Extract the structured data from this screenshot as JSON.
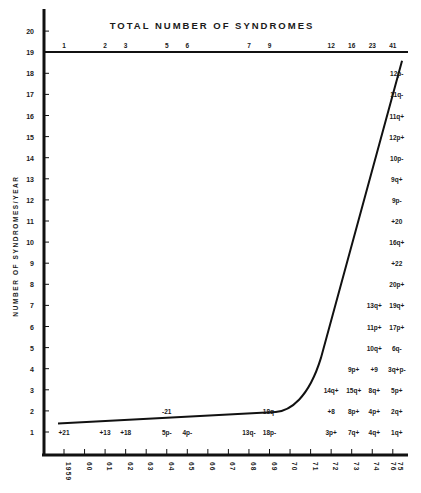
{
  "chart_data": {
    "type": "line",
    "title": "TOTAL NUMBER OF SYNDROMES",
    "xlabel": "",
    "ylabel": "NUMBER OF SYNDROMES/YEAR",
    "ylim": [
      0,
      20
    ],
    "y_ticks": [
      "1",
      "2",
      "3",
      "4",
      "5",
      "6",
      "7",
      "8",
      "9",
      "10",
      "11",
      "12",
      "13",
      "14",
      "15",
      "16",
      "17",
      "18",
      "19",
      "20"
    ],
    "x_ticks": [
      "1959",
      "60",
      "61",
      "62",
      "63",
      "64",
      "65",
      "66",
      "67",
      "68",
      "69",
      "70",
      "71",
      "72",
      "73",
      "74",
      "75 76"
    ],
    "grid": false,
    "top_axis_label": "TOTAL NUMBER OF SYNDROMES",
    "top_axis_cumulative": [
      {
        "year": "1959",
        "total": "1"
      },
      {
        "year": "61",
        "total": "2"
      },
      {
        "year": "62",
        "total": "3"
      },
      {
        "year": "64",
        "total": "5"
      },
      {
        "year": "65",
        "total": "6"
      },
      {
        "year": "68",
        "total": "7"
      },
      {
        "year": "69",
        "total": "9"
      },
      {
        "year": "72",
        "total": "12"
      },
      {
        "year": "73",
        "total": "16"
      },
      {
        "year": "74",
        "total": "23"
      },
      {
        "year": "75-76",
        "total": "41"
      }
    ],
    "curve": {
      "description": "cumulative trend curve",
      "x": [
        1959,
        1962,
        1965,
        1968,
        1969.3,
        1970,
        1971,
        1971.8,
        1975.5
      ],
      "y": [
        1.4,
        1.55,
        1.7,
        1.85,
        1.95,
        2.2,
        3.5,
        5.0,
        18.6
      ]
    },
    "annotations": [
      {
        "text": "+21",
        "year": "1959",
        "row": 1
      },
      {
        "text": "+13",
        "year": "61",
        "row": 1
      },
      {
        "text": "+18",
        "year": "62",
        "row": 1
      },
      {
        "text": "5p-",
        "year": "64",
        "row": 1
      },
      {
        "text": "4p-",
        "year": "65",
        "row": 1
      },
      {
        "text": "-21",
        "year": "64",
        "row": 2
      },
      {
        "text": "13q-",
        "year": "68",
        "row": 1
      },
      {
        "text": "18p-",
        "year": "69",
        "row": 1
      },
      {
        "text": "18q-",
        "year": "69",
        "row": 2
      },
      {
        "text": "3p+",
        "year": "72",
        "row": 1
      },
      {
        "text": "+8",
        "year": "72",
        "row": 2
      },
      {
        "text": "14q+",
        "year": "72",
        "row": 3
      },
      {
        "text": "7q+",
        "year": "73",
        "row": 1
      },
      {
        "text": "8p+",
        "year": "73",
        "row": 2
      },
      {
        "text": "15q+",
        "year": "73",
        "row": 3
      },
      {
        "text": "9p+",
        "year": "73",
        "row": 4
      },
      {
        "text": "4q+",
        "year": "74",
        "row": 1
      },
      {
        "text": "4p+",
        "year": "74",
        "row": 2
      },
      {
        "text": "8q+",
        "year": "74",
        "row": 3
      },
      {
        "text": "+9",
        "year": "74",
        "row": 4
      },
      {
        "text": "10q+",
        "year": "74",
        "row": 5
      },
      {
        "text": "11p+",
        "year": "74",
        "row": 6
      },
      {
        "text": "13q+",
        "year": "74",
        "row": 7
      },
      {
        "text": "1q+",
        "year": "75-76",
        "row": 1
      },
      {
        "text": "2q+",
        "year": "75-76",
        "row": 2
      },
      {
        "text": "5p+",
        "year": "75-76",
        "row": 3
      },
      {
        "text": "3q+p-",
        "year": "75-76",
        "row": 4
      },
      {
        "text": "6q-",
        "year": "75-76",
        "row": 5
      },
      {
        "text": "17p+",
        "year": "75-76",
        "row": 6
      },
      {
        "text": "19q+",
        "year": "75-76",
        "row": 7
      },
      {
        "text": "20p+",
        "year": "75-76",
        "row": 8
      },
      {
        "text": "+22",
        "year": "75-76",
        "row": 9
      },
      {
        "text": "16q+",
        "year": "75-76",
        "row": 10
      },
      {
        "text": "+20",
        "year": "75-76",
        "row": 11
      },
      {
        "text": "9p-",
        "year": "75-76",
        "row": 12
      },
      {
        "text": "9q+",
        "year": "75-76",
        "row": 13
      },
      {
        "text": "10p-",
        "year": "75-76",
        "row": 14
      },
      {
        "text": "12p+",
        "year": "75-76",
        "row": 15
      },
      {
        "text": "11q+",
        "year": "75-76",
        "row": 16
      },
      {
        "text": "11q-",
        "year": "75-76",
        "row": 17
      },
      {
        "text": "12p-",
        "year": "75-76",
        "row": 18
      }
    ]
  }
}
